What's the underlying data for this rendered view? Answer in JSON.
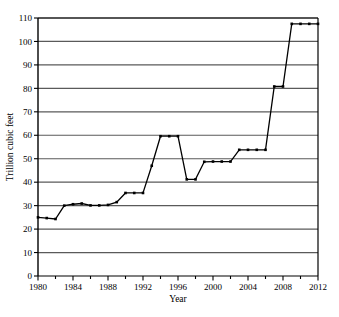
{
  "chart_data": {
    "type": "line",
    "title": "",
    "xlabel": "Year",
    "ylabel": "Trillion cubic feet",
    "xlim": [
      1980,
      2012
    ],
    "ylim": [
      0,
      110
    ],
    "xticks": [
      1980,
      1984,
      1988,
      1992,
      1996,
      2000,
      2004,
      2008,
      2012
    ],
    "xtick_labels": [
      "1980",
      "1984",
      "1988",
      "1992",
      "1996",
      "2000",
      "2004",
      "2008",
      "2012"
    ],
    "xminor_step": 2,
    "yticks": [
      0,
      10,
      20,
      30,
      40,
      50,
      60,
      70,
      80,
      90,
      100,
      110
    ],
    "ytick_labels": [
      "0",
      "10",
      "20",
      "30",
      "40",
      "50",
      "60",
      "70",
      "80",
      "90",
      "100",
      "110"
    ],
    "grid": "horizontal",
    "legend": "none",
    "marker": "square",
    "line_color": "#000000",
    "grid_color": "#5a5a5a",
    "axis_color": "#000000",
    "x": [
      1980,
      1981,
      1982,
      1983,
      1984,
      1985,
      1986,
      1987,
      1988,
      1989,
      1990,
      1991,
      1992,
      1993,
      1994,
      1995,
      1996,
      1997,
      1998,
      1999,
      2000,
      2001,
      2002,
      2003,
      2004,
      2005,
      2006,
      2007,
      2008,
      2009,
      2010,
      2011,
      2012
    ],
    "values": [
      25.0,
      24.7,
      24.3,
      30.0,
      30.6,
      30.9,
      30.1,
      30.1,
      30.3,
      31.5,
      35.4,
      35.4,
      35.4,
      47.0,
      59.6,
      59.6,
      59.6,
      41.2,
      41.2,
      48.7,
      48.8,
      48.8,
      48.8,
      53.8,
      53.8,
      53.8,
      53.8,
      80.8,
      80.8,
      107.5,
      107.5,
      107.5,
      107.5
    ],
    "series": [
      {
        "name": "Natural gas proved reserves",
        "values": [
          25.0,
          24.7,
          24.3,
          30.0,
          30.6,
          30.9,
          30.1,
          30.1,
          30.3,
          31.5,
          35.4,
          35.4,
          35.4,
          47.0,
          59.6,
          59.6,
          59.6,
          41.2,
          41.2,
          48.7,
          48.8,
          48.8,
          48.8,
          53.8,
          53.8,
          53.8,
          53.8,
          80.8,
          80.8,
          107.5,
          107.5,
          107.5,
          107.5
        ]
      }
    ]
  }
}
